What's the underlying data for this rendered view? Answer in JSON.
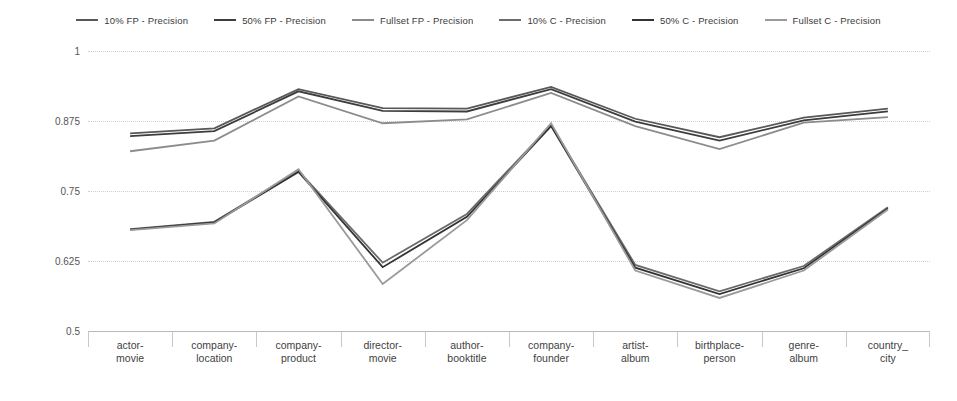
{
  "chart_data": {
    "type": "line",
    "title": "",
    "xlabel": "",
    "ylabel": "Precision",
    "ylim": [
      0.5,
      1
    ],
    "yticks": [
      "0.5",
      "0.625",
      "0.75",
      "0.875",
      "1"
    ],
    "grid": true,
    "legend_position": "top",
    "categories": [
      "actor-movie",
      "company-location",
      "company-product",
      "director-movie",
      "author-booktitle",
      "company-founder",
      "artist-album",
      "birthplace-person",
      "genre-album",
      "country_city"
    ],
    "series": [
      {
        "name": "10% FP - Precision",
        "color": "#585858",
        "values": [
          0.853,
          0.862,
          0.932,
          0.898,
          0.897,
          0.936,
          0.879,
          0.846,
          0.881,
          0.897
        ]
      },
      {
        "name": "50% FP - Precision",
        "color": "#3d3d3d",
        "values": [
          0.848,
          0.857,
          0.928,
          0.893,
          0.892,
          0.932,
          0.874,
          0.84,
          0.876,
          0.892
        ]
      },
      {
        "name": "Fullset FP - Precision",
        "color": "#8c8c8c",
        "values": [
          0.821,
          0.84,
          0.919,
          0.871,
          0.878,
          0.925,
          0.866,
          0.825,
          0.872,
          0.882
        ]
      },
      {
        "name": "10% C - Precision",
        "color": "#6b6b6b",
        "values": [
          0.682,
          0.695,
          0.786,
          0.622,
          0.709,
          0.868,
          0.618,
          0.571,
          0.616,
          0.721
        ]
      },
      {
        "name": "50% C - Precision",
        "color": "#333333",
        "values": [
          0.681,
          0.694,
          0.784,
          0.614,
          0.704,
          0.866,
          0.613,
          0.566,
          0.612,
          0.719
        ]
      },
      {
        "name": "Fullset C - Precision",
        "color": "#9a9a9a",
        "values": [
          0.68,
          0.692,
          0.789,
          0.584,
          0.698,
          0.871,
          0.608,
          0.559,
          0.608,
          0.717
        ]
      }
    ]
  },
  "legend": {
    "items": [
      {
        "label": "10% FP - Precision"
      },
      {
        "label": "50% FP - Precision"
      },
      {
        "label": "Fullset FP - Precision"
      },
      {
        "label": "10% C - Precision"
      },
      {
        "label": "50% C - Precision"
      },
      {
        "label": "Fullset C - Precision"
      }
    ]
  },
  "axis": {
    "y_title": "Precision",
    "y_ticks": [
      "1",
      "0.875",
      "0.75",
      "0.625",
      "0.5"
    ],
    "x_categories": [
      {
        "line1": "actor-",
        "line2": "movie"
      },
      {
        "line1": "company-",
        "line2": "location"
      },
      {
        "line1": "company-",
        "line2": "product"
      },
      {
        "line1": "director-",
        "line2": "movie"
      },
      {
        "line1": "author-",
        "line2": "booktitle"
      },
      {
        "line1": "company-",
        "line2": "founder"
      },
      {
        "line1": "artist-",
        "line2": "album"
      },
      {
        "line1": "birthplace-",
        "line2": "person"
      },
      {
        "line1": "genre-",
        "line2": "album"
      },
      {
        "line1": "country_",
        "line2": "city"
      }
    ]
  },
  "colors": {
    "background": "#ffffff",
    "gridline": "#cfcfcf",
    "axis": "#b9b9b9",
    "text": "#404040"
  }
}
